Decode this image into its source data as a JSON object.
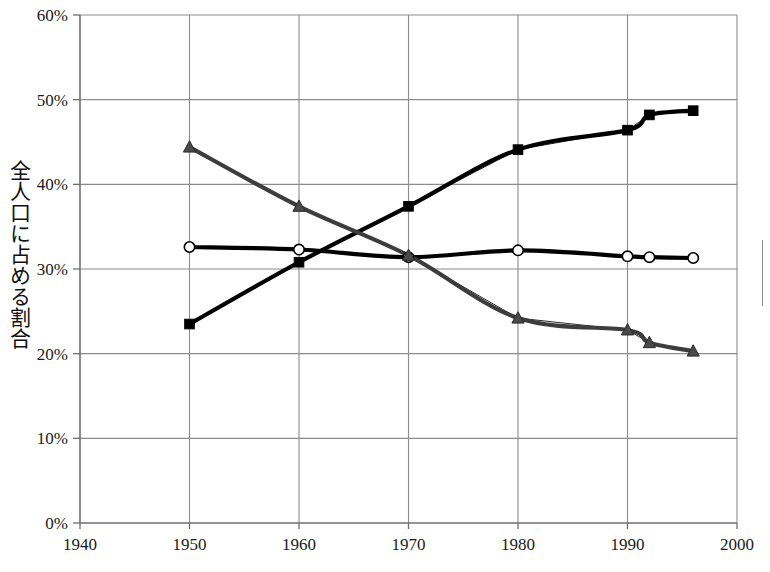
{
  "chart_data": {
    "type": "line",
    "title": "",
    "xlabel": "",
    "ylabel": "全人口に占める割合",
    "xlim": [
      1940,
      2000
    ],
    "ylim": [
      0,
      0.6
    ],
    "x_ticks": [
      "1940",
      "1950",
      "1960",
      "1970",
      "1980",
      "1990",
      "2000"
    ],
    "x_tick_values": [
      1940,
      1950,
      1960,
      1970,
      1980,
      1990,
      2000
    ],
    "y_ticks": [
      "0%",
      "10%",
      "20%",
      "30%",
      "40%",
      "50%",
      "60%"
    ],
    "y_tick_values": [
      0,
      10,
      20,
      30,
      40,
      50,
      60
    ],
    "grid": true,
    "legend_position": "right-outside-cropped",
    "series": [
      {
        "name": "series-squares",
        "marker": "square",
        "color": "#000000",
        "x": [
          1950,
          1960,
          1970,
          1980,
          1990,
          1992,
          1996
        ],
        "values": [
          23.5,
          30.8,
          37.4,
          44.1,
          46.4,
          48.2,
          48.7
        ]
      },
      {
        "name": "series-circles",
        "marker": "circle-open",
        "color": "#000000",
        "x": [
          1950,
          1960,
          1970,
          1980,
          1990,
          1992,
          1996
        ],
        "values": [
          32.6,
          32.3,
          31.4,
          32.2,
          31.5,
          31.4,
          31.3
        ]
      },
      {
        "name": "series-triangles",
        "marker": "triangle",
        "color": "#3d3d3d",
        "x": [
          1950,
          1960,
          1970,
          1980,
          1990,
          1992,
          1996
        ],
        "values": [
          44.4,
          37.4,
          31.6,
          24.2,
          22.8,
          21.3,
          20.3
        ]
      }
    ]
  },
  "plot": {
    "area": {
      "left": 80,
      "top": 15,
      "right": 737,
      "bottom": 523
    },
    "axis_color": "#7d7d7d",
    "grid_color": "#8c8c8c",
    "series_line_color": "#000000",
    "background": "#ffffff"
  },
  "legend": {
    "visible_fragment": true,
    "note": ""
  }
}
